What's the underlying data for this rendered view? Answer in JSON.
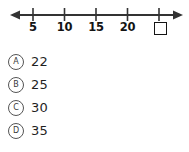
{
  "question": {
    "figure": {
      "type": "number-line",
      "axis": {
        "left_arrow": "left-arrow",
        "right_arrow": "right-arrow",
        "line_y": 15,
        "start_x": 10,
        "end_x": 183
      },
      "ticks": [
        {
          "label": "5",
          "x": 33
        },
        {
          "label": "10",
          "x": 64
        },
        {
          "label": "15",
          "x": 96
        },
        {
          "label": "20",
          "x": 128
        },
        {
          "label": "",
          "x": 159,
          "placeholder": true
        }
      ],
      "placeholder_symbol": "empty-square",
      "step": 5
    },
    "choices": [
      {
        "letter": "A",
        "value": "22"
      },
      {
        "letter": "B",
        "value": "25"
      },
      {
        "letter": "C",
        "value": "30"
      },
      {
        "letter": "D",
        "value": "35"
      }
    ]
  },
  "colors": {
    "ink": "#141414",
    "line": "#333333",
    "bullet_stroke": "#555555",
    "background": "#ffffff"
  }
}
